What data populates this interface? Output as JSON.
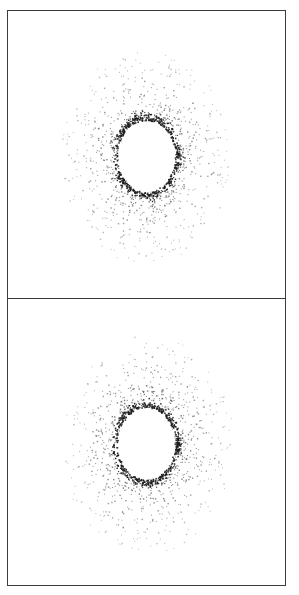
{
  "figure": {
    "width": 299,
    "height": 595,
    "background_color": "#ffffff",
    "frame_color": "#3b3b3b",
    "marker_color": "#4a4a4a",
    "marker_color_dark": "#1a1a1a",
    "panel_count": 2
  },
  "chart_data": [
    {
      "type": "scatter",
      "name": "panel-top",
      "title": "",
      "xlabel": "",
      "ylabel": "",
      "grid": false,
      "legend": null,
      "tick_labels_x": [],
      "tick_labels_y": [],
      "xlim": [
        -1.15,
        1.15
      ],
      "ylim": [
        -1.15,
        1.15
      ],
      "point_count": 1120,
      "description": "Annular point cloud with empty elliptical core, dense inner boundary ring and radially fanning spokes fading outward",
      "structure": {
        "center_x": 0.0,
        "center_y": 0.0,
        "inner_radius_x": 0.34,
        "inner_radius_y": 0.4,
        "outer_radius": 1.0,
        "spoke_count": 26,
        "radial_ellipticity": 0.88,
        "seed": 1371
      }
    },
    {
      "type": "scatter",
      "name": "panel-bottom",
      "title": "",
      "xlabel": "",
      "ylabel": "",
      "grid": false,
      "legend": null,
      "tick_labels_x": [],
      "tick_labels_y": [],
      "xlim": [
        -1.15,
        1.15
      ],
      "ylim": [
        -1.15,
        1.15
      ],
      "point_count": 1120,
      "description": "Annular point cloud with empty elliptical core, dense inner boundary ring and radially fanning spokes fading outward",
      "structure": {
        "center_x": 0.0,
        "center_y": 0.0,
        "inner_radius_x": 0.34,
        "inner_radius_y": 0.4,
        "outer_radius": 1.0,
        "spoke_count": 26,
        "radial_ellipticity": 0.88,
        "seed": 8842
      }
    }
  ]
}
